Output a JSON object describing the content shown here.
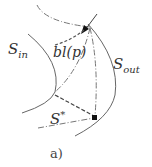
{
  "diagram": {
    "labels": {
      "s_in": {
        "main": "S",
        "sub": "in"
      },
      "s_out": {
        "main": "S",
        "sub": "out"
      },
      "bl": "bl(p)",
      "s_star": {
        "main": "S",
        "sup": "*"
      }
    },
    "caption": "a)",
    "colors": {
      "line": "#555555",
      "point": "#111111"
    }
  }
}
